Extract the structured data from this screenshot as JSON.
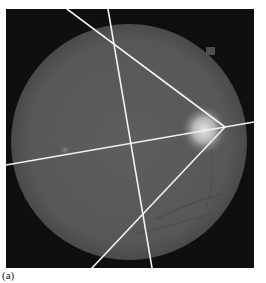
{
  "figure": {
    "caption": "(a)",
    "image_subject": "retinal fundus photograph with overlaid lines",
    "colors": {
      "background": "#0f0f0f",
      "fundus": "#5a5a5a",
      "optic_disc": "#d8d8d8",
      "lines": "#f2f2f2"
    }
  }
}
